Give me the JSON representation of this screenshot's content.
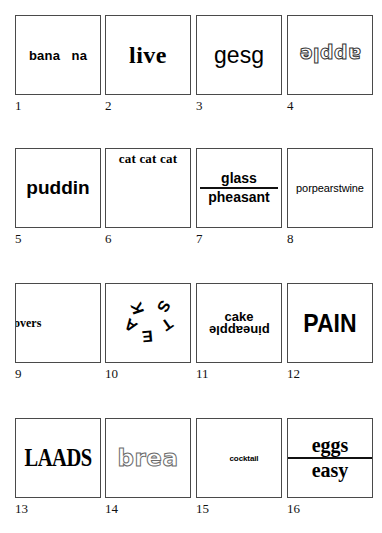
{
  "sheet": {
    "title": "Word stimulus grid",
    "columns": 4,
    "rows": 4,
    "border_color": "#4a4a4a",
    "background_color": "#ffffff",
    "text_color": "#000000"
  },
  "cells": [
    {
      "index": "1",
      "text": "bana   na",
      "style": "bold sans, word split by a gap",
      "orientation": "upright",
      "position": "center"
    },
    {
      "index": "2",
      "text": "live",
      "style": "bold serif, large",
      "orientation": "upright",
      "position": "center"
    },
    {
      "index": "3",
      "text": "gesg",
      "style": "plain sans, large",
      "orientation": "upright",
      "position": "center"
    },
    {
      "index": "4",
      "text": "apple",
      "style": "outlined rounded sans",
      "orientation": "rotated-180",
      "position": "center"
    },
    {
      "index": "5",
      "text": "puddin",
      "style": "bold sans",
      "orientation": "upright",
      "position": "center"
    },
    {
      "index": "6",
      "text": "cat cat cat",
      "style": "bold serif",
      "orientation": "upright",
      "position": "top"
    },
    {
      "index": "7",
      "numerator": "glass",
      "denominator": "pheasant",
      "style": "bold sans fraction with horizontal rule",
      "orientation": "upright",
      "position": "center"
    },
    {
      "index": "8",
      "text": "porpearstwine",
      "style": "plain sans, small, spans box width",
      "orientation": "upright",
      "position": "center"
    },
    {
      "index": "9",
      "text": "overs",
      "style": "bold serif, clipped at left border",
      "orientation": "upright",
      "position": "left"
    },
    {
      "index": "10",
      "letters": [
        "K",
        "S",
        "T",
        "E",
        "A"
      ],
      "style": "bold sans letters scattered in a ring at varied rotations",
      "orientation": "scattered",
      "position": "center"
    },
    {
      "index": "11",
      "top_text": "cake",
      "bottom_text": "pineapple",
      "style": "bold sans; bottom word rotated 180",
      "orientation": "mixed",
      "position": "center"
    },
    {
      "index": "12",
      "text": "PAIN",
      "style": "heavy condensed sans, uppercase",
      "orientation": "upright",
      "position": "center"
    },
    {
      "index": "13",
      "text": "LAADS",
      "style": "bold condensed serif, uppercase",
      "orientation": "upright",
      "position": "center"
    },
    {
      "index": "14",
      "text": "brea",
      "style": "outlined rounded sans",
      "orientation": "upright",
      "position": "center"
    },
    {
      "index": "15",
      "text": "cocktail",
      "style": "bold sans, very small",
      "orientation": "upright",
      "position": "center-left"
    },
    {
      "index": "16",
      "numerator": "eggs",
      "denominator": "easy",
      "style": "bold serif fraction with horizontal rule",
      "orientation": "upright",
      "position": "center"
    }
  ]
}
